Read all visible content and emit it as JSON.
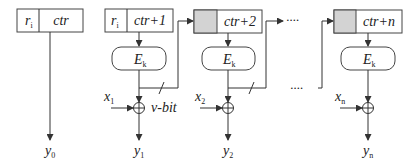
{
  "diagram": {
    "type": "counter-mode-encryption",
    "stage0": {
      "nonce_label": "r",
      "nonce_sub": "i",
      "counter_label": "ctr",
      "output_label": "y",
      "output_sub": "0"
    },
    "stages": [
      {
        "nonce_label": "r",
        "nonce_sub": "i",
        "nonce_shaded": false,
        "counter_label": "ctr+1",
        "cipher_label": "E",
        "cipher_sub": "k",
        "input_label": "x",
        "input_sub": "1",
        "output_label": "y",
        "output_sub": "1",
        "feedback_label": "v-bit"
      },
      {
        "nonce_label": "",
        "nonce_sub": "",
        "nonce_shaded": true,
        "counter_label": "ctr+2",
        "cipher_label": "E",
        "cipher_sub": "k",
        "input_label": "x",
        "input_sub": "2",
        "output_label": "y",
        "output_sub": "2"
      },
      {
        "nonce_label": "",
        "nonce_sub": "",
        "nonce_shaded": true,
        "counter_label": "ctr+n",
        "cipher_label": "E",
        "cipher_sub": "k",
        "input_label": "x",
        "input_sub": "n",
        "output_label": "y",
        "output_sub": "n"
      }
    ],
    "ellipsis": "····",
    "colors": {
      "line": "#333333",
      "shaded": "#d3d3d3",
      "background": "#ffffff"
    }
  }
}
